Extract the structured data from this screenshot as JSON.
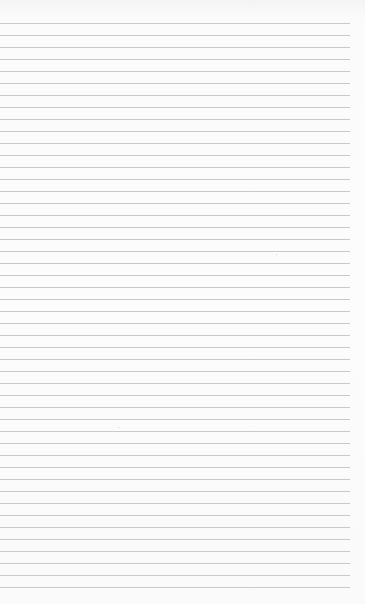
{
  "page": {
    "type": "blank ruled paper",
    "background_color": "#fbfbfb",
    "rule_color": "#c9c9c9",
    "rule_count": 48,
    "first_rule_y": 23,
    "rule_spacing": 12,
    "rule_right_edge": 350
  }
}
